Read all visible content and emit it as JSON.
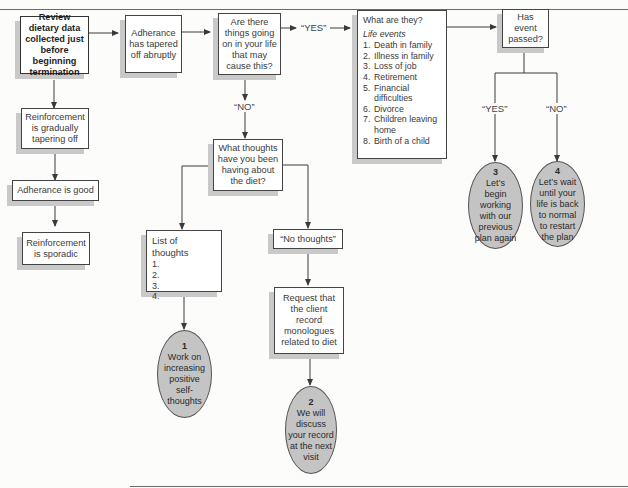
{
  "diagram": {
    "start": "Review dietary data collected just before beginning termination",
    "abrupt": "Adherance has tapered off abruptly",
    "question_life": "Are there things going on in your life that may cause this?",
    "yes_label_1": "“YES”",
    "no_label_1": "“NO”",
    "what_are_they": {
      "title": "What are they?",
      "subtitle": "Life events",
      "items": [
        {
          "n": "1.",
          "text": "Death in family"
        },
        {
          "n": "2.",
          "text": "Illness in family"
        },
        {
          "n": "3.",
          "text": "Loss of job"
        },
        {
          "n": "4.",
          "text": "Retirement"
        },
        {
          "n": "5.",
          "text": "Financial difficulties"
        },
        {
          "n": "6.",
          "text": "Divorce"
        },
        {
          "n": "7.",
          "text": "Children leaving home"
        },
        {
          "n": "8.",
          "text": "Birth of a child"
        }
      ]
    },
    "event_passed": "Has event passed?",
    "yes_label_2": "“YES”",
    "no_label_2": "“NO”",
    "gradual": "Reinforcement is gradually tapering off",
    "adherence_good": "Adherance is good",
    "sporadic": "Reinforcement is sporadic",
    "thoughts_question": "What thoughts have you been having about the diet?",
    "list_of_thoughts": {
      "title": "List of thoughts",
      "items": [
        "1.",
        "2.",
        "3.",
        "4."
      ]
    },
    "no_thoughts": "“No thoughts”",
    "request": "Request that the client record monologues related to diet",
    "outcomes": [
      {
        "num": "1",
        "text": "Work on increasing positive self-thoughts"
      },
      {
        "num": "2",
        "text": "We will discuss your record at the next visit"
      },
      {
        "num": "3",
        "text": "Let’s begin working with our previous plan again"
      },
      {
        "num": "4",
        "text": "Let’s wait until your life is back to normal to restart the plan"
      }
    ]
  },
  "colors": {
    "line": "#3a3a3a",
    "oval_fill": "#c4c4c4",
    "shadow": "#c9c9c9"
  }
}
